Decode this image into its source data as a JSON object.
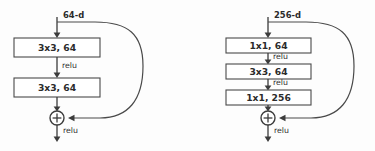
{
  "figure": {
    "background_color": "#fdfdfd",
    "stroke_color": "#3c3c3c",
    "box_fill": "#ffffff",
    "text_color": "#2b2b2b"
  },
  "blocks": [
    {
      "id": "basic-block",
      "name": "basic-residual-block",
      "input_dim_label": "64-d",
      "layers": [
        {
          "label": "3x3, 64"
        },
        {
          "label": "3x3, 64"
        }
      ],
      "activations": [
        {
          "label": "relu",
          "position": "between-layer-1-and-2"
        },
        {
          "label": "relu",
          "position": "after-addition"
        }
      ],
      "merge_op": "+"
    },
    {
      "id": "bottleneck-block",
      "name": "bottleneck-residual-block",
      "input_dim_label": "256-d",
      "layers": [
        {
          "label": "1x1, 64"
        },
        {
          "label": "3x3, 64"
        },
        {
          "label": "1x1, 256"
        }
      ],
      "activations": [
        {
          "label": "relu",
          "position": "between-layer-1-and-2"
        },
        {
          "label": "relu",
          "position": "between-layer-2-and-3"
        },
        {
          "label": "relu",
          "position": "after-addition"
        }
      ],
      "merge_op": "+"
    }
  ]
}
